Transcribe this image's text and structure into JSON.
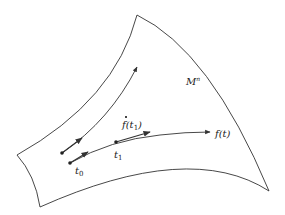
{
  "diagram": {
    "manifold_label": "M",
    "manifold_superscript": "n",
    "curve_label": "f(t)",
    "tangent_label_prefix": "f",
    "tangent_label_arg_open": "(t",
    "tangent_label_arg_sub": "1",
    "tangent_label_arg_close": ")",
    "point_t0_label": "t",
    "point_t0_sub": "0",
    "point_t1_label": "t",
    "point_t1_sub": "1",
    "colors": {
      "stroke": "#333333",
      "background": "#ffffff"
    }
  }
}
